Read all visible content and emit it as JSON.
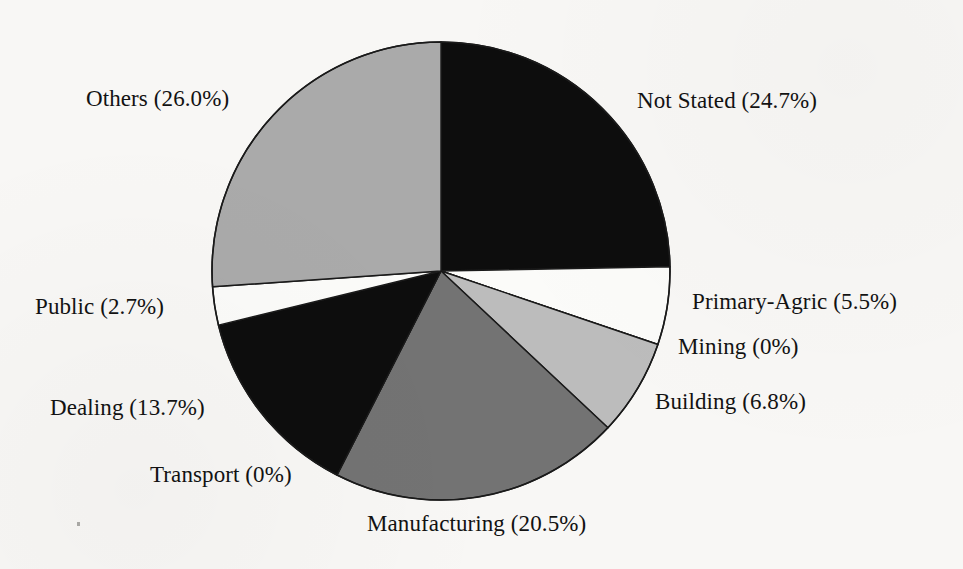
{
  "figure": {
    "background_color": "#f8f7f5",
    "outline_color": "#1a1a1a"
  },
  "chart_data": {
    "type": "pie",
    "title": "",
    "subtitle": "",
    "xlabel": "",
    "ylabel": "",
    "legend_position": "none",
    "grid": false,
    "label_format": "{name} ({value}%)",
    "start_angle_deg": 0,
    "direction": "clockwise",
    "center": {
      "x": 441,
      "y": 271
    },
    "radius": 229,
    "categories": [
      "Not Stated",
      "Primary-Agric",
      "Mining",
      "Building",
      "Manufacturing",
      "Transport",
      "Dealing",
      "Public",
      "Others"
    ],
    "values": [
      24.7,
      5.5,
      0,
      6.8,
      20.5,
      0,
      13.7,
      2.7,
      26.0
    ],
    "colors": [
      "#0d0d0d",
      "#fbfbf9",
      "#fbfbf9",
      "#bcbcbc",
      "#737373",
      "#0d0d0d",
      "#0d0d0d",
      "#fbfbf9",
      "#aaaaaa"
    ],
    "slices": [
      {
        "name": "Not Stated",
        "value": 24.7,
        "label": "Not Stated (24.7%)",
        "color": "#0d0d0d",
        "start_angle_deg": 0.0,
        "end_angle_deg": 88.92,
        "label_x": 637,
        "label_y": 88
      },
      {
        "name": "Primary-Agric",
        "value": 5.5,
        "label": "Primary-Agric (5.5%)",
        "color": "#fbfbf9",
        "start_angle_deg": 88.92,
        "end_angle_deg": 108.72,
        "label_x": 692,
        "label_y": 289
      },
      {
        "name": "Mining",
        "value": 0,
        "label": "Mining (0%)",
        "color": "#fbfbf9",
        "start_angle_deg": 108.72,
        "end_angle_deg": 108.72,
        "label_x": 678,
        "label_y": 334
      },
      {
        "name": "Building",
        "value": 6.8,
        "label": "Building (6.8%)",
        "color": "#bcbcbc",
        "start_angle_deg": 108.72,
        "end_angle_deg": 133.2,
        "label_x": 655,
        "label_y": 389
      },
      {
        "name": "Manufacturing",
        "value": 20.5,
        "label": "Manufacturing (20.5%)",
        "color": "#737373",
        "start_angle_deg": 133.2,
        "end_angle_deg": 207.0,
        "label_x": 367,
        "label_y": 511
      },
      {
        "name": "Transport",
        "value": 0,
        "label": "Transport (0%)",
        "color": "#0d0d0d",
        "start_angle_deg": 207.0,
        "end_angle_deg": 207.0,
        "label_x": 150,
        "label_y": 462
      },
      {
        "name": "Dealing",
        "value": 13.7,
        "label": "Dealing (13.7%)",
        "color": "#0d0d0d",
        "start_angle_deg": 207.0,
        "end_angle_deg": 256.32,
        "label_x": 50,
        "label_y": 395
      },
      {
        "name": "Public",
        "value": 2.7,
        "label": "Public (2.7%)",
        "color": "#fbfbf9",
        "start_angle_deg": 256.32,
        "end_angle_deg": 266.04,
        "label_x": 35,
        "label_y": 294
      },
      {
        "name": "Others",
        "value": 26.0,
        "label": "Others (26.0%)",
        "color": "#aaaaaa",
        "start_angle_deg": 266.04,
        "end_angle_deg": 360.0,
        "label_x": 86,
        "label_y": 86
      }
    ]
  }
}
